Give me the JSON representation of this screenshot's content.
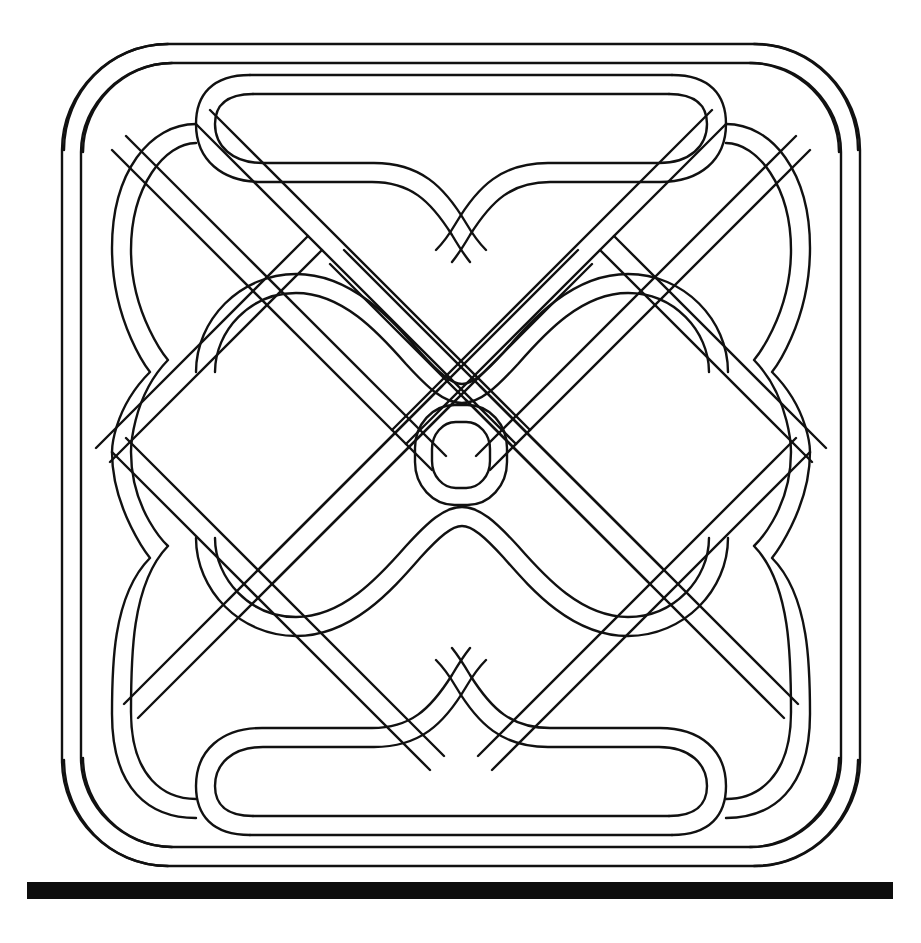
{
  "artwork": {
    "title": "Celtic interlace knot panel",
    "type": "line-drawing",
    "background_color": "#ffffff",
    "ink_color": "#111111",
    "canvas": {
      "width": 921,
      "height": 943
    },
    "stroke_width_px": 2.4,
    "band_width_px": 19
  },
  "baseline_bar": {
    "name": "solid-rule",
    "color": "#0d0d0d",
    "x": 27,
    "y": 882,
    "width": 866,
    "height": 17
  },
  "knot": {
    "bounds": {
      "x": 52,
      "y": 34,
      "width": 818,
      "height": 836
    },
    "symmetry": "4-fold mirror (vertical + horizontal axes)",
    "center": {
      "x": 461,
      "y": 452
    },
    "center_ring": {
      "name": "central-rounded-square-ring",
      "cx": 461,
      "cy": 455,
      "outer_rx": 46,
      "outer_ry": 50,
      "inner_rx": 29,
      "inner_ry": 33,
      "corner_radius": 22
    },
    "elements": [
      {
        "name": "outer-frame-band",
        "description": "Rounded rectangular outer cord framing the panel"
      },
      {
        "name": "top-horizontal-band",
        "description": "Upper straight cord with central dip"
      },
      {
        "name": "bottom-horizontal-band",
        "description": "Lower straight cord with central rise"
      },
      {
        "name": "left-wave-column",
        "description": "Left vertical cord with three lobes"
      },
      {
        "name": "right-wave-column",
        "description": "Right vertical cord with three lobes"
      },
      {
        "name": "diagonal-lattice-nw-se",
        "description": "Diagonal cords running north-west to south-east"
      },
      {
        "name": "diagonal-lattice-ne-sw",
        "description": "Diagonal cords running north-east to south-west"
      },
      {
        "name": "corner-loop-top-left",
        "description": "Crossing loop at the top-left corner"
      },
      {
        "name": "corner-loop-top-right",
        "description": "Crossing loop at the top-right corner"
      },
      {
        "name": "corner-loop-bottom-left",
        "description": "Crossing loop at the bottom-left corner"
      },
      {
        "name": "corner-loop-bottom-right",
        "description": "Crossing loop at the bottom-right corner"
      },
      {
        "name": "upper-inner-arc-pair",
        "description": "Twin arcs forming a wave above the centre"
      },
      {
        "name": "lower-inner-arc-pair",
        "description": "Twin arcs forming a wave below the centre"
      }
    ]
  },
  "chart_data": {
    "type": "table",
    "categories": [
      "bands",
      "crossings",
      "corner loops",
      "central rings"
    ],
    "values": [
      8,
      36,
      4,
      2
    ]
  }
}
